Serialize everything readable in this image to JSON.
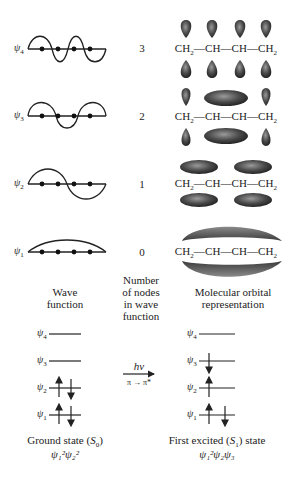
{
  "wave_functions": [
    {
      "psi": "ψ",
      "index": "4",
      "nodes": "3",
      "formula": [
        "CH",
        "2",
        "—CH—CH—CH",
        "2"
      ]
    },
    {
      "psi": "ψ",
      "index": "3",
      "nodes": "2",
      "formula": [
        "CH",
        "2",
        "—CH—CH—CH",
        "2"
      ]
    },
    {
      "psi": "ψ",
      "index": "2",
      "nodes": "1",
      "formula": [
        "CH",
        "2",
        "—CH—CH—CH",
        "2"
      ]
    },
    {
      "psi": "ψ",
      "index": "1",
      "nodes": "0",
      "formula": [
        "CH",
        "2",
        "—CH—CH—CH",
        "2"
      ]
    }
  ],
  "column_headers": {
    "wave": [
      "Wave",
      "function"
    ],
    "nodes": [
      "Number",
      "of nodes",
      "in wave",
      "function"
    ],
    "orbital": [
      "Molecular orbital",
      "representation"
    ]
  },
  "energy_diagram": {
    "levels": [
      "4",
      "3",
      "2",
      "1"
    ],
    "ground": {
      "title_prefix": "Ground state (",
      "title_sym": "S",
      "title_sub": "0",
      "title_suffix": ")",
      "config": "ψ₁²ψ₂²",
      "occupancy": {
        "4": "empty",
        "3": "empty",
        "2": "paired",
        "1": "paired"
      }
    },
    "excited": {
      "title_prefix": "First excited (",
      "title_sym": "S",
      "title_sub": "1",
      "title_suffix": ") state",
      "config": "ψ₁²ψ₂ψ₃",
      "occupancy": {
        "4": "empty",
        "3": "down",
        "2": "up",
        "1": "paired"
      }
    },
    "arrow_top": "hν",
    "arrow_bottom": "π → π*"
  }
}
